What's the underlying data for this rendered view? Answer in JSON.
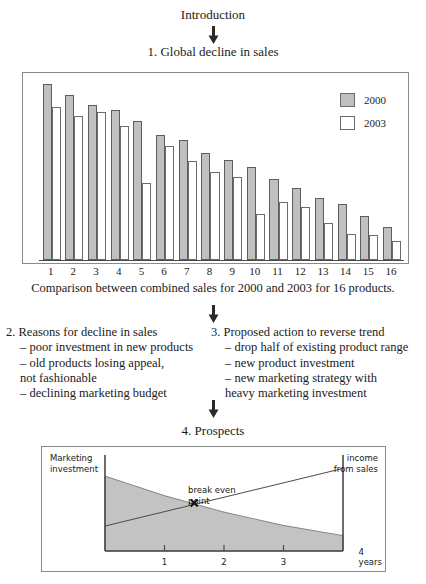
{
  "intro": {
    "title": "Introduction"
  },
  "section1": {
    "title": "1. Global decline in sales",
    "caption": "Comparison between combined sales for 2000 and 2003 for 16 products."
  },
  "chart_data": {
    "type": "bar",
    "title": "1. Global decline in sales",
    "subtitle": "Comparison between combined sales for 2000 and 2003 for 16 products.",
    "xlabel": "",
    "ylabel": "",
    "grid": false,
    "legend_position": "top-right",
    "ylim": [
      0,
      100
    ],
    "categories": [
      "1",
      "2",
      "3",
      "4",
      "5",
      "6",
      "7",
      "8",
      "9",
      "10",
      "11",
      "12",
      "13",
      "14",
      "15",
      "16"
    ],
    "series": [
      {
        "name": "2000",
        "color": "#c0c0c0",
        "values": [
          100,
          94,
          88,
          85,
          79,
          71,
          68,
          61,
          57,
          53,
          46,
          41,
          35,
          32,
          25,
          19
        ]
      },
      {
        "name": "2003",
        "color": "#ffffff",
        "values": [
          87,
          82,
          84,
          76,
          44,
          65,
          56,
          50,
          47,
          26,
          33,
          30,
          21,
          15,
          14,
          11
        ]
      }
    ]
  },
  "legend": {
    "items": [
      {
        "label": "2000",
        "swatch": "grey"
      },
      {
        "label": "2003",
        "swatch": "white"
      }
    ]
  },
  "section2": {
    "heading": "2. Reasons for decline in sales",
    "items": [
      "– poor investment in new products",
      "– old products losing appeal,",
      "   not fashionable",
      "– declining marketing budget"
    ]
  },
  "section3": {
    "heading": "3. Proposed action to reverse trend",
    "items": [
      "– drop half of existing product range",
      "– new product investment",
      "– new marketing strategy with",
      "   heavy marketing investment"
    ]
  },
  "section4": {
    "title": "4. Prospects",
    "chart": {
      "type": "line",
      "label_left": "Marketing\ninvestment",
      "label_right": "income\nfrom sales",
      "annotation": "break even\npoint",
      "xticks": [
        "1",
        "2",
        "3",
        "4 years"
      ],
      "series": [
        {
          "name": "Marketing investment",
          "points": [
            [
              0,
              78
            ],
            [
              4,
              16
            ]
          ]
        },
        {
          "name": "Income from sales",
          "points": [
            [
              0,
              26
            ],
            [
              4,
              86
            ]
          ]
        }
      ],
      "crossing_point": [
        1.5,
        50
      ]
    }
  },
  "icons": {
    "arrow_down": "down-arrow"
  },
  "colors": {
    "bar_2000": "#c0c0c0",
    "bar_2003": "#ffffff",
    "border": "#8a8a8a",
    "shade": "#c3c3c3",
    "text": "#1a1a1a"
  }
}
